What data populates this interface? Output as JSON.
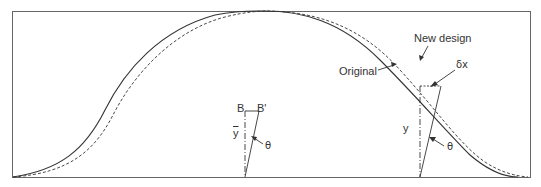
{
  "diagram": {
    "type": "beam-deflection-shape-comparison",
    "labels": {
      "new_design": "New design",
      "original": "Original",
      "delta_x": "δx",
      "y": "y",
      "y_bar": "y",
      "theta_left": "θ",
      "theta_right": "θ",
      "point_b": "B",
      "point_b_prime": "B'"
    },
    "curves": [
      {
        "name": "Original",
        "style": "solid"
      },
      {
        "name": "New design",
        "style": "dashed"
      }
    ],
    "colors": {
      "line": "#333333",
      "frame": "#555555",
      "background": "#ffffff"
    }
  }
}
